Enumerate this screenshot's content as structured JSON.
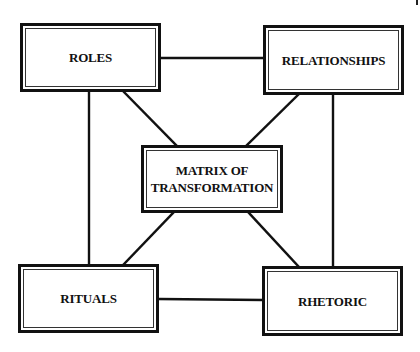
{
  "diagram": {
    "type": "network",
    "colors": {
      "background": "#ffffff",
      "stroke": "#111111",
      "text": "#111111"
    },
    "nodes": [
      {
        "id": "roles",
        "label_lines": [
          "ROLES"
        ]
      },
      {
        "id": "relationships",
        "label_lines": [
          "RELATIONSHIPS"
        ]
      },
      {
        "id": "matrix",
        "label_lines": [
          "MATRIX OF",
          "TRANSFORMATION"
        ]
      },
      {
        "id": "rituals",
        "label_lines": [
          "RITUALS"
        ]
      },
      {
        "id": "rhetoric",
        "label_lines": [
          "RHETORIC"
        ]
      }
    ],
    "edges": [
      {
        "from": "roles",
        "to": "relationships"
      },
      {
        "from": "rituals",
        "to": "rhetoric"
      },
      {
        "from": "roles",
        "to": "rituals"
      },
      {
        "from": "relationships",
        "to": "rhetoric"
      },
      {
        "from": "roles",
        "to": "matrix"
      },
      {
        "from": "relationships",
        "to": "matrix"
      },
      {
        "from": "rituals",
        "to": "matrix"
      },
      {
        "from": "rhetoric",
        "to": "matrix"
      }
    ]
  }
}
